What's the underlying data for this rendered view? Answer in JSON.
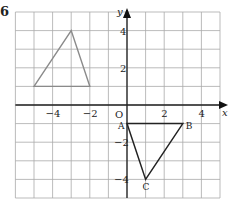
{
  "question_number": "6",
  "axes": {
    "x_label": "x",
    "y_label": "y",
    "origin_label": "O",
    "x_range": [
      -6,
      5
    ],
    "y_range": [
      -5,
      5
    ],
    "x_ticks": [
      {
        "v": -4,
        "label": "−4"
      },
      {
        "v": -2,
        "label": "−2"
      },
      {
        "v": 2,
        "label": "2"
      },
      {
        "v": 4,
        "label": "4"
      }
    ],
    "y_ticks": [
      {
        "v": 4,
        "label": "4"
      },
      {
        "v": 2,
        "label": "2"
      },
      {
        "v": -2,
        "label": "−2"
      },
      {
        "v": -4,
        "label": "−4"
      }
    ]
  },
  "shapes": {
    "image_triangle": {
      "points": [
        [
          -5,
          1
        ],
        [
          -3,
          4
        ],
        [
          -2,
          1
        ]
      ],
      "color": "#8a8a8a"
    },
    "triangle_ABC": {
      "points": [
        [
          0,
          -1
        ],
        [
          3,
          -1
        ],
        [
          1,
          -4
        ]
      ],
      "labels": [
        "A",
        "B",
        "C"
      ],
      "color": "#222222"
    }
  }
}
